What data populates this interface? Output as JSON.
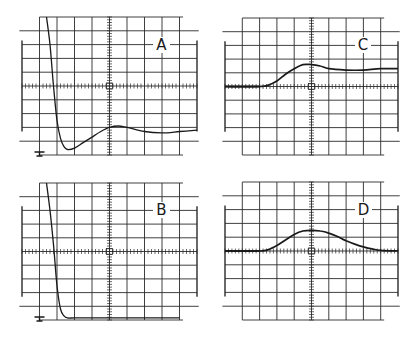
{
  "figure": {
    "grid": {
      "h_divisions": 10,
      "v_divisions": 10,
      "minor_ticks_per_division": 5
    }
  },
  "panels": [
    {
      "id": "A",
      "label": "A",
      "x": 22,
      "y": 17,
      "w": 175,
      "h": 138
    },
    {
      "id": "C",
      "label": "C",
      "x": 225,
      "y": 18,
      "w": 173,
      "h": 137
    },
    {
      "id": "B",
      "label": "B",
      "x": 22,
      "y": 183,
      "w": 175,
      "h": 137
    },
    {
      "id": "D",
      "label": "D",
      "x": 225,
      "y": 182,
      "w": 173,
      "h": 138
    }
  ],
  "chart_data": [
    {
      "type": "line",
      "title": "A",
      "xlabel": "",
      "ylabel": "",
      "xlim": [
        -5,
        5
      ],
      "ylim": [
        -5,
        5
      ],
      "grid": true,
      "description": "Sharp drop from top, undershoot then damped oscillation settling below center",
      "x": [
        -3.6,
        -3.4,
        -3.2,
        -3.0,
        -2.8,
        -2.6,
        -2.4,
        -2.0,
        -1.5,
        -1.0,
        -0.5,
        0.0,
        0.5,
        1.0,
        2.0,
        3.0,
        4.0,
        5.0
      ],
      "y": [
        5.0,
        3.0,
        0.0,
        -2.5,
        -3.8,
        -4.4,
        -4.6,
        -4.5,
        -4.1,
        -3.7,
        -3.3,
        -3.0,
        -2.9,
        -3.0,
        -3.3,
        -3.4,
        -3.3,
        -3.2
      ]
    },
    {
      "type": "line",
      "title": "C",
      "xlabel": "",
      "ylabel": "",
      "xlim": [
        -5,
        5
      ],
      "ylim": [
        -5,
        5
      ],
      "grid": true,
      "description": "Flat baseline, rise to overshoot near center, settle slightly above baseline",
      "x": [
        -5.0,
        -3.0,
        -2.5,
        -2.0,
        -1.5,
        -1.0,
        -0.5,
        0.0,
        0.5,
        1.0,
        2.0,
        3.0,
        4.0,
        5.0
      ],
      "y": [
        0.0,
        0.0,
        0.1,
        0.4,
        0.9,
        1.3,
        1.6,
        1.6,
        1.5,
        1.3,
        1.2,
        1.2,
        1.3,
        1.3
      ]
    },
    {
      "type": "line",
      "title": "B",
      "xlabel": "",
      "ylabel": "",
      "xlim": [
        -5,
        5
      ],
      "ylim": [
        -5,
        5
      ],
      "grid": true,
      "description": "Sharp drop from top to bottom with no overshoot, then flat near bottom",
      "x": [
        -3.6,
        -3.4,
        -3.2,
        -3.0,
        -2.8,
        -2.6,
        -2.4,
        -2.0,
        -1.0,
        0.0,
        1.0,
        2.0,
        3.0,
        4.0
      ],
      "y": [
        5.0,
        3.0,
        0.5,
        -2.5,
        -4.2,
        -4.7,
        -4.85,
        -4.85,
        -4.85,
        -4.85,
        -4.85,
        -4.85,
        -4.85,
        -4.85
      ]
    },
    {
      "type": "line",
      "title": "D",
      "xlabel": "",
      "ylabel": "",
      "xlim": [
        -5,
        5
      ],
      "ylim": [
        -5,
        5
      ],
      "grid": true,
      "description": "Flat baseline, smooth bell-shaped pulse peaking at center, slower decay",
      "x": [
        -5.0,
        -3.0,
        -2.5,
        -2.0,
        -1.5,
        -1.0,
        -0.5,
        0.0,
        0.5,
        1.0,
        1.5,
        2.0,
        2.5,
        3.0,
        3.5,
        4.0,
        5.0
      ],
      "y": [
        0.0,
        0.0,
        0.1,
        0.4,
        0.8,
        1.2,
        1.45,
        1.5,
        1.45,
        1.3,
        1.05,
        0.75,
        0.5,
        0.3,
        0.15,
        0.05,
        0.0
      ]
    }
  ]
}
